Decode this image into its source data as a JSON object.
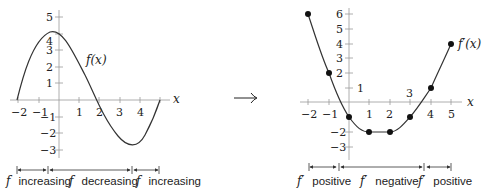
{
  "left_plot": {
    "curve_label": "f(x)",
    "x_axis_label": "x",
    "x_ticks": [
      "−2",
      "−1",
      "1",
      "2",
      "3",
      "4"
    ],
    "y_ticks": [
      "5",
      "4",
      "3",
      "2",
      "1",
      "−1",
      "−2",
      "−3"
    ],
    "intervals": [
      {
        "f": "f",
        "text": "increasing"
      },
      {
        "f": "f",
        "text": "decreasing"
      },
      {
        "f": "f",
        "text": "increasing"
      }
    ]
  },
  "arrow": "→",
  "right_plot": {
    "curve_label": "f′(x)",
    "x_axis_label": "x",
    "x_ticks": [
      "−2",
      "−1",
      "1",
      "2",
      "3",
      "4",
      "5"
    ],
    "y_ticks": [
      "6",
      "5",
      "4",
      "3",
      "2",
      "1",
      "−2",
      "−3"
    ],
    "points": [
      [
        -2,
        6
      ],
      [
        -1,
        2
      ],
      [
        0,
        -1
      ],
      [
        1,
        -2
      ],
      [
        2,
        -2
      ],
      [
        3,
        -1
      ],
      [
        4,
        1
      ],
      [
        5,
        4
      ]
    ],
    "intervals": [
      {
        "f": "f′",
        "text": "positive"
      },
      {
        "f": "f′",
        "text": "negative"
      },
      {
        "f": "f′",
        "text": "positive"
      }
    ]
  }
}
